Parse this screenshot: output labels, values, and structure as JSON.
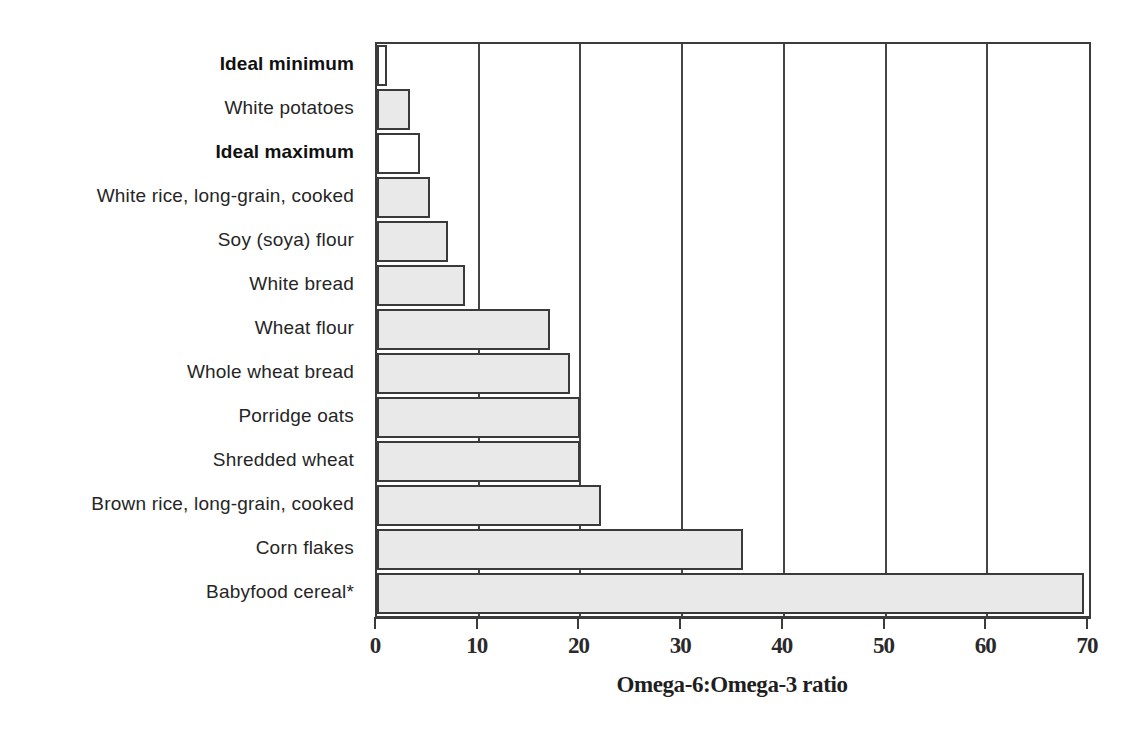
{
  "chart_data": {
    "type": "bar",
    "orientation": "horizontal",
    "title": "",
    "xlabel": "Omega-6:Omega-3 ratio",
    "ylabel": "",
    "xlim": [
      0,
      70
    ],
    "xticks": [
      0,
      10,
      20,
      30,
      40,
      50,
      60,
      70
    ],
    "xtick_labels": [
      "0",
      "10",
      "20",
      "30",
      "40",
      "50",
      "60",
      "70"
    ],
    "grid": "vertical",
    "legend": "none",
    "categories": [
      "Ideal minimum",
      "White potatoes",
      "Ideal maximum",
      "White rice, long-grain, cooked",
      "Soy (soya) flour",
      "White bread",
      "Wheat flour",
      "Whole wheat bread",
      "Porridge oats",
      "Shredded wheat",
      "Brown rice, long-grain, cooked",
      "Corn flakes",
      "Babyfood cereal*"
    ],
    "values": [
      1,
      3.2,
      4.2,
      5.2,
      7,
      8.7,
      17,
      19,
      20,
      20,
      22,
      36,
      69.5
    ],
    "bars": [
      {
        "label": "Ideal minimum",
        "value": 1,
        "emphasis": true,
        "fill": "white"
      },
      {
        "label": "White potatoes",
        "value": 3.2,
        "emphasis": false,
        "fill": "gray"
      },
      {
        "label": "Ideal maximum",
        "value": 4.2,
        "emphasis": true,
        "fill": "white"
      },
      {
        "label": "White rice, long-grain, cooked",
        "value": 5.2,
        "emphasis": false,
        "fill": "gray"
      },
      {
        "label": "Soy (soya) flour",
        "value": 7,
        "emphasis": false,
        "fill": "gray"
      },
      {
        "label": "White bread",
        "value": 8.7,
        "emphasis": false,
        "fill": "gray"
      },
      {
        "label": "Wheat flour",
        "value": 17,
        "emphasis": false,
        "fill": "gray"
      },
      {
        "label": "Whole wheat bread",
        "value": 19,
        "emphasis": false,
        "fill": "gray"
      },
      {
        "label": "Porridge oats",
        "value": 20,
        "emphasis": false,
        "fill": "gray"
      },
      {
        "label": "Shredded wheat",
        "value": 20,
        "emphasis": false,
        "fill": "gray"
      },
      {
        "label": "Brown rice, long-grain, cooked",
        "value": 22,
        "emphasis": false,
        "fill": "gray"
      },
      {
        "label": "Corn flakes",
        "value": 36,
        "emphasis": false,
        "fill": "gray"
      },
      {
        "label": "Babyfood cereal*",
        "value": 69.5,
        "emphasis": false,
        "fill": "gray"
      }
    ],
    "colors": {
      "bar_fill": "#e9e9e9",
      "bar_fill_alt": "#ffffff",
      "bar_edge": "#3a3a3a",
      "axis": "#3b3b3b",
      "gridline": "#454545",
      "text": "#262626",
      "background": "#ffffff"
    }
  }
}
